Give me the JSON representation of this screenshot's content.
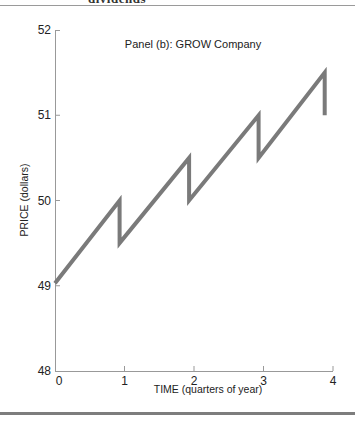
{
  "header": {
    "cut_heading": "dividends"
  },
  "chart_data": {
    "type": "line",
    "title": "Panel (b): GROW Company",
    "xlabel": "TIME (quarters of year)",
    "ylabel": "PRICE (dollars)",
    "xlim": [
      0,
      4
    ],
    "ylim": [
      48,
      52
    ],
    "x_ticks": [
      0,
      1,
      2,
      3,
      4
    ],
    "x_tick_labels": [
      "0",
      "1",
      "2",
      "3",
      "4"
    ],
    "y_ticks": [
      48,
      49,
      50,
      51,
      52
    ],
    "y_tick_labels": [
      "48",
      "49",
      "50",
      "51",
      "52"
    ],
    "grid": false,
    "legend": null,
    "line_color": "#7a7a7a",
    "series": [
      {
        "name": "GROW Company price",
        "points": [
          [
            0.0,
            49.03
          ],
          [
            0.93,
            50.0
          ],
          [
            0.93,
            49.5
          ],
          [
            1.93,
            50.5
          ],
          [
            1.93,
            50.0
          ],
          [
            2.93,
            51.0
          ],
          [
            2.93,
            50.5
          ],
          [
            3.88,
            51.5
          ],
          [
            3.88,
            51.0
          ]
        ]
      }
    ]
  }
}
